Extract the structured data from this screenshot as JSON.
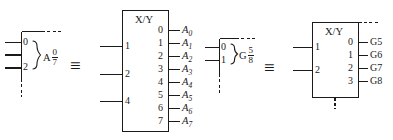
{
  "figure": {
    "type": "iec-logic-symbol-equivalence",
    "background_color": "#ffffff",
    "line_color": "#1a1a1a",
    "equivalence_symbol": "≡"
  },
  "equivalences": [
    {
      "id": "address-decoder",
      "compact_symbol": {
        "name": "A 0/7 compact dependency notation",
        "qualifier_letter": "A",
        "range_numerator": "0",
        "range_denominator": "7",
        "input_pins": [
          "0",
          "",
          "2"
        ],
        "visible_pin_labels": [
          "0",
          "2"
        ]
      },
      "equiv_glyph": "≡",
      "expanded_symbol": {
        "title": "X/Y",
        "inputs": [
          "1",
          "2",
          "4"
        ],
        "outputs": [
          {
            "pin": "0",
            "label": "A",
            "sub": "0"
          },
          {
            "pin": "1",
            "label": "A",
            "sub": "1"
          },
          {
            "pin": "2",
            "label": "A",
            "sub": "2"
          },
          {
            "pin": "3",
            "label": "A",
            "sub": "3"
          },
          {
            "pin": "4",
            "label": "A",
            "sub": "4"
          },
          {
            "pin": "5",
            "label": "A",
            "sub": "5"
          },
          {
            "pin": "6",
            "label": "A",
            "sub": "6"
          },
          {
            "pin": "7",
            "label": "A",
            "sub": "7"
          }
        ]
      }
    },
    {
      "id": "gate-group",
      "compact_symbol": {
        "name": "G 5/8 compact dependency notation",
        "qualifier_letter": "G",
        "range_numerator": "5",
        "range_denominator": "8",
        "input_pins": [
          "0",
          "1"
        ],
        "visible_pin_labels": [
          "0",
          "1"
        ]
      },
      "equiv_glyph": "≡",
      "expanded_symbol": {
        "title": "X/Y",
        "inputs": [
          "1",
          "2"
        ],
        "outputs": [
          {
            "pin": "0",
            "label": "G5",
            "sub": ""
          },
          {
            "pin": "1",
            "label": "G6",
            "sub": ""
          },
          {
            "pin": "2",
            "label": "G7",
            "sub": ""
          },
          {
            "pin": "3",
            "label": "G8",
            "sub": ""
          }
        ]
      }
    }
  ]
}
